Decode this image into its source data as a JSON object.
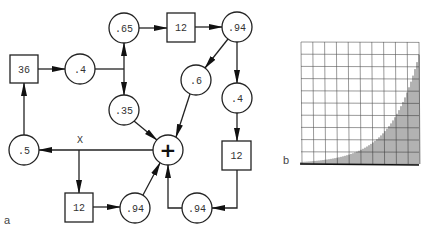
{
  "diagram": {
    "panel_label": "a",
    "nodes": [
      {
        "id": "box36",
        "shape": "box",
        "label": "36"
      },
      {
        "id": "c_04_left",
        "shape": "circle",
        "label": ".4"
      },
      {
        "id": "c_065",
        "shape": "circle",
        "label": ".65"
      },
      {
        "id": "box12_top",
        "shape": "box",
        "label": "12"
      },
      {
        "id": "c_094_top",
        "shape": "circle",
        "label": ".94"
      },
      {
        "id": "c_06",
        "shape": "circle",
        "label": ".6"
      },
      {
        "id": "c_04_right",
        "shape": "circle",
        "label": ".4"
      },
      {
        "id": "c_035",
        "shape": "circle",
        "label": ".35"
      },
      {
        "id": "sum",
        "shape": "circle",
        "label": "+"
      },
      {
        "id": "c_05",
        "shape": "circle",
        "label": ".5"
      },
      {
        "id": "box12_bottom",
        "shape": "box",
        "label": "12"
      },
      {
        "id": "c_094_bottom",
        "shape": "circle",
        "label": ".94"
      },
      {
        "id": "box12_right",
        "shape": "box",
        "label": "12"
      },
      {
        "id": "c_094_bottomright",
        "shape": "circle",
        "label": ".94"
      }
    ],
    "output_label": "X",
    "edges": [
      [
        "box36",
        "c_04_left"
      ],
      [
        "c_04_left",
        "c_065"
      ],
      [
        "c_04_left",
        "c_035"
      ],
      [
        "c_065",
        "box12_top"
      ],
      [
        "box12_top",
        "c_094_top"
      ],
      [
        "c_094_top",
        "c_06"
      ],
      [
        "c_094_top",
        "c_04_right"
      ],
      [
        "c_06",
        "sum"
      ],
      [
        "c_035",
        "sum"
      ],
      [
        "c_04_right",
        "box12_right"
      ],
      [
        "box12_right",
        "c_094_bottomright"
      ],
      [
        "c_094_bottomright",
        "sum"
      ],
      [
        "sum",
        "c_05"
      ],
      [
        "sum",
        "box12_bottom"
      ],
      [
        "box12_bottom",
        "c_094_bottom"
      ],
      [
        "c_094_bottom",
        "sum"
      ],
      [
        "c_05",
        "box36"
      ]
    ]
  },
  "chart": {
    "panel_label": "b",
    "grid_columns": 10,
    "grid_rows": 10
  },
  "chart_data": {
    "type": "bar",
    "title": "",
    "xlabel": "",
    "ylabel": "",
    "grid": true,
    "bar_count": 60,
    "values_relative": "exponential growth, near 0 at left rising to ~0.88 of grid height at right",
    "ylim": [
      0,
      1
    ]
  }
}
